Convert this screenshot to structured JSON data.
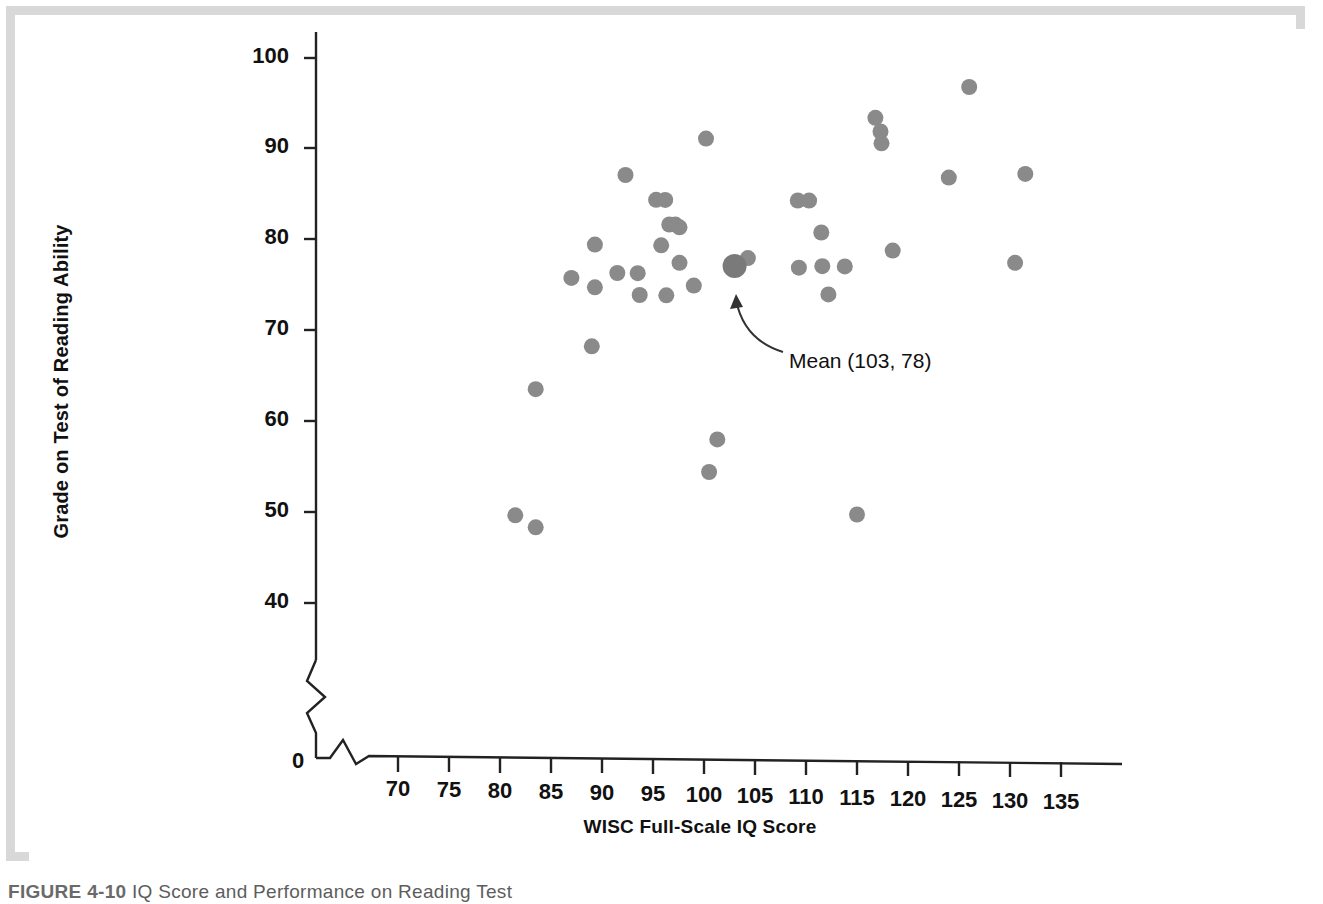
{
  "chart_data": {
    "type": "scatter",
    "title": "",
    "xlabel": "WISC Full-Scale IQ Score",
    "ylabel": "Grade on Test of Reading Ability",
    "xlim": [
      67,
      139
    ],
    "ylim": [
      38,
      103
    ],
    "grid": false,
    "legend": null,
    "xticks": [
      70,
      75,
      80,
      85,
      90,
      95,
      100,
      105,
      110,
      115,
      120,
      125,
      130,
      135
    ],
    "yticks": [
      40,
      50,
      60,
      70,
      80,
      90,
      100
    ],
    "axis_break_x": true,
    "axis_break_y": true,
    "origin_label": "0",
    "point_color": "#8a8a8a",
    "series": [
      {
        "name": "Students",
        "points": [
          [
            81.5,
            49.8
          ],
          [
            83.5,
            48.5
          ],
          [
            83.5,
            63.7
          ],
          [
            87.0,
            76.0
          ],
          [
            89.0,
            68.5
          ],
          [
            89.3,
            75.0
          ],
          [
            89.3,
            79.7
          ],
          [
            91.5,
            76.6
          ],
          [
            92.3,
            87.4
          ],
          [
            93.5,
            76.6
          ],
          [
            93.7,
            74.2
          ],
          [
            95.3,
            84.7
          ],
          [
            96.2,
            84.7
          ],
          [
            95.8,
            79.7
          ],
          [
            96.3,
            74.2
          ],
          [
            96.6,
            82.0
          ],
          [
            97.2,
            82.0
          ],
          [
            97.6,
            81.7
          ],
          [
            97.6,
            77.8
          ],
          [
            99.0,
            75.3
          ],
          [
            100.2,
            91.5
          ],
          [
            100.5,
            54.8
          ],
          [
            101.3,
            58.4
          ],
          [
            104.3,
            78.4
          ],
          [
            109.2,
            84.8
          ],
          [
            110.3,
            84.8
          ],
          [
            109.3,
            77.4
          ],
          [
            111.5,
            81.3
          ],
          [
            111.6,
            77.6
          ],
          [
            112.2,
            74.5
          ],
          [
            113.8,
            77.6
          ],
          [
            115.0,
            50.3
          ],
          [
            116.8,
            94.0
          ],
          [
            117.3,
            92.5
          ],
          [
            117.4,
            91.2
          ],
          [
            118.5,
            79.4
          ],
          [
            124.0,
            87.5
          ],
          [
            126.0,
            97.5
          ],
          [
            130.5,
            78.2
          ],
          [
            131.5,
            88.0
          ]
        ]
      },
      {
        "name": "Mean",
        "points": [
          [
            103.0,
            77.5
          ]
        ],
        "marker_size": "large"
      }
    ],
    "annotations": [
      {
        "text": "Mean (103, 78)",
        "points_to": [
          103.0,
          77.5
        ],
        "arrow": "curved"
      }
    ]
  },
  "figure": {
    "ylabel": "Grade on Test of Reading Ability",
    "xlabel": "WISC Full-Scale IQ Score",
    "mean_annotation": "Mean (103, 78)",
    "origin": "0",
    "xticks": [
      "70",
      "75",
      "80",
      "85",
      "90",
      "95",
      "100",
      "105",
      "110",
      "115",
      "120",
      "125",
      "130",
      "135"
    ],
    "yticks": [
      "100",
      "90",
      "80",
      "70",
      "60",
      "50",
      "40"
    ]
  },
  "caption": {
    "label": "FIGURE 4-10",
    "text": "IQ Score and Performance on Reading Test"
  }
}
